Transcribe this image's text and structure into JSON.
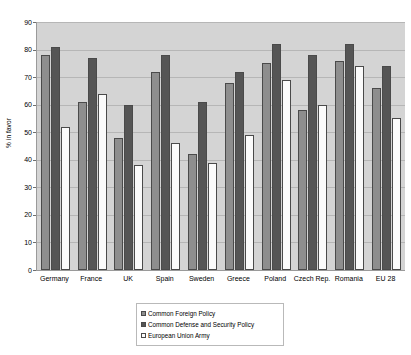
{
  "chart_data": {
    "type": "bar",
    "title": "",
    "xlabel": "",
    "ylabel": "% in favor",
    "ylim": [
      0,
      90
    ],
    "ytick_step": 10,
    "yticks": [
      "90",
      "80",
      "70",
      "60",
      "50",
      "40",
      "30",
      "20",
      "10",
      "0"
    ],
    "grid": true,
    "legend_position": "bottom-center",
    "categories": [
      "Germany",
      "France",
      "UK",
      "Spain",
      "Sweden",
      "Greece",
      "Poland",
      "Czech Rep.",
      "Romania",
      "EU 28"
    ],
    "series": [
      {
        "name": "Common Foreign Policy",
        "color": "#8e8e8e",
        "values": [
          78,
          61,
          48,
          72,
          42,
          68,
          75,
          58,
          76,
          66
        ]
      },
      {
        "name": "Common Defense and Security Policy",
        "color": "#555555",
        "values": [
          81,
          77,
          60,
          78,
          61,
          72,
          82,
          78,
          82,
          74
        ]
      },
      {
        "name": "European Union Army",
        "color": "#fbfbfb",
        "values": [
          52,
          64,
          38,
          46,
          39,
          49,
          69,
          60,
          74,
          55
        ]
      }
    ],
    "plot_background": "#d4d4d4",
    "gridline_color": "#b6b6b6",
    "axis_color": "#9a9a9a"
  }
}
